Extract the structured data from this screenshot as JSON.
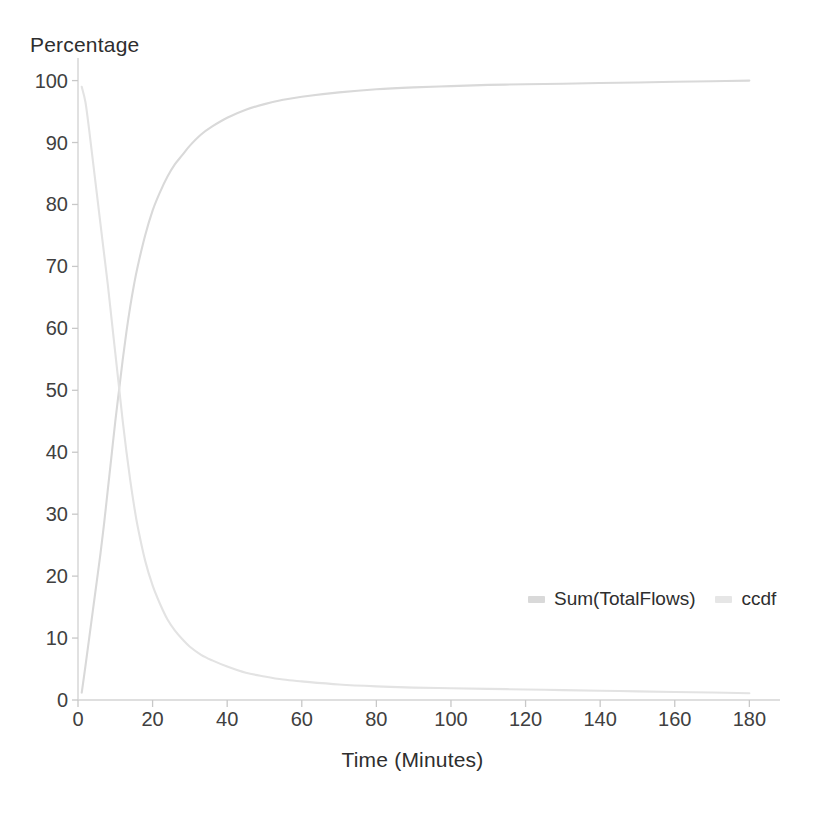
{
  "chart_data": {
    "type": "line",
    "title": "",
    "xlabel": "Time (Minutes)",
    "ylabel": "Percentage",
    "xlim": [
      0,
      185
    ],
    "ylim": [
      0,
      103
    ],
    "grid": false,
    "legend_position": "inside-right",
    "xticks": [
      0,
      20,
      40,
      60,
      80,
      100,
      120,
      140,
      160,
      180
    ],
    "yticks": [
      0,
      10,
      20,
      30,
      40,
      50,
      60,
      70,
      80,
      90,
      100
    ],
    "annotations": [],
    "series": [
      {
        "name": "Sum(TotalFlows)",
        "color": "#d9d9d9",
        "x": [
          1,
          2,
          3,
          4,
          5,
          6,
          7,
          8,
          9,
          10,
          11,
          12,
          13,
          14,
          15,
          16,
          18,
          20,
          22,
          24,
          26,
          28,
          30,
          33,
          36,
          40,
          45,
          50,
          55,
          60,
          70,
          80,
          90,
          100,
          110,
          120,
          130,
          140,
          150,
          160,
          170,
          180
        ],
        "values": [
          1.2,
          5.5,
          10.0,
          14.5,
          19.0,
          23.5,
          28.5,
          34.0,
          39.5,
          45.0,
          50.0,
          55.0,
          59.5,
          63.5,
          67.0,
          70.0,
          75.0,
          79.0,
          82.0,
          84.5,
          86.5,
          88.0,
          89.5,
          91.3,
          92.6,
          94.0,
          95.3,
          96.2,
          96.9,
          97.4,
          98.1,
          98.6,
          98.9,
          99.1,
          99.3,
          99.4,
          99.5,
          99.6,
          99.7,
          99.8,
          99.9,
          100.0
        ]
      },
      {
        "name": "ccdf",
        "color": "#e3e3e3",
        "x": [
          1,
          2,
          3,
          4,
          5,
          6,
          7,
          8,
          9,
          10,
          11,
          12,
          13,
          14,
          15,
          16,
          18,
          20,
          22,
          24,
          26,
          28,
          30,
          33,
          36,
          40,
          45,
          50,
          55,
          60,
          70,
          80,
          90,
          100,
          110,
          120,
          130,
          140,
          150,
          160,
          170,
          180
        ],
        "values": [
          99.0,
          96.5,
          92.0,
          87.0,
          82.0,
          77.0,
          72.0,
          67.0,
          61.5,
          56.0,
          50.5,
          45.0,
          40.0,
          35.5,
          31.5,
          28.0,
          22.5,
          18.5,
          15.5,
          13.0,
          11.2,
          9.8,
          8.6,
          7.3,
          6.4,
          5.4,
          4.4,
          3.8,
          3.3,
          3.0,
          2.5,
          2.2,
          2.0,
          1.9,
          1.8,
          1.7,
          1.6,
          1.5,
          1.4,
          1.3,
          1.2,
          1.1
        ]
      }
    ]
  },
  "axes": {
    "axis_color": "#d5d5d5",
    "tick_color": "#c8c8c8",
    "label_color": "#3a3a3a"
  },
  "legend": {
    "items": [
      {
        "label": "Sum(TotalFlows)",
        "color": "#d9d9d9"
      },
      {
        "label": "ccdf",
        "color": "#e6e6e6"
      }
    ]
  },
  "background": "#ffffff"
}
